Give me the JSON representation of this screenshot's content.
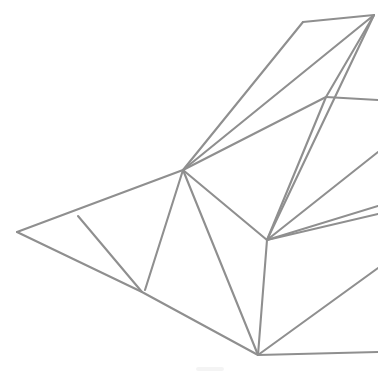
{
  "figure": {
    "width": 378,
    "height": 374,
    "background_color": "#ffffff",
    "stroke_color": "#8f8f8f",
    "stroke_width": 2.1,
    "style": "wireframe-outline"
  },
  "vertices": {
    "hub": {
      "name": "central-hub",
      "x": 183,
      "y": 170
    },
    "left_tip": {
      "name": "left-tip",
      "x": 17,
      "y": 232
    },
    "upper_branch": {
      "name": "upper-left-branch",
      "x": 78,
      "y": 216
    },
    "lower_branch": {
      "name": "lower-left-branch",
      "x": 142,
      "y": 292
    },
    "bottom": {
      "name": "bottom-apex",
      "x": 258,
      "y": 355
    },
    "mid_right": {
      "name": "mid-right-node",
      "x": 267,
      "y": 240
    },
    "top_corner": {
      "name": "top-left-corner",
      "x": 303,
      "y": 22
    },
    "top_right": {
      "name": "top-right-apex",
      "x": 374,
      "y": 15
    },
    "right_cross": {
      "name": "right-cross-node",
      "x": 326,
      "y": 97
    },
    "edge_r1": {
      "name": "right-edge-exit-1",
      "x": 378,
      "y": 100
    },
    "edge_r2": {
      "name": "right-edge-exit-2",
      "x": 378,
      "y": 152
    },
    "edge_r3": {
      "name": "right-edge-exit-3",
      "x": 378,
      "y": 206
    },
    "edge_r4": {
      "name": "right-edge-exit-4",
      "x": 378,
      "y": 214
    },
    "edge_r5": {
      "name": "right-edge-exit-5",
      "x": 378,
      "y": 268
    },
    "edge_r6": {
      "name": "right-edge-exit-6",
      "x": 378,
      "y": 352
    }
  },
  "edges": [
    {
      "id": "e01",
      "name": "hub-to-left-tip",
      "path": "M 183 170 L 17 232"
    },
    {
      "id": "e02",
      "name": "left-tip-to-lower-branch",
      "path": "M 17 232 L 142 292"
    },
    {
      "id": "e03",
      "name": "upper-branch-to-lower-branch",
      "path": "M 78 216 L 142 292"
    },
    {
      "id": "e04",
      "name": "hub-to-lower-branch-inner",
      "path": "M 183 170 L 145 290"
    },
    {
      "id": "e05",
      "name": "lower-branch-to-bottom",
      "path": "M 142 292 L 258 355"
    },
    {
      "id": "e06",
      "name": "hub-to-bottom",
      "path": "M 183 170 L 258 355"
    },
    {
      "id": "e07",
      "name": "hub-to-mid-right",
      "path": "M 183 170 L 267 240"
    },
    {
      "id": "e08",
      "name": "mid-right-to-bottom",
      "path": "M 267 240 L 258 355"
    },
    {
      "id": "e09",
      "name": "hub-to-right-cross",
      "path": "M 183 170 L 326 97"
    },
    {
      "id": "e10",
      "name": "hub-to-top-corner",
      "path": "M 183 170 L 303 22"
    },
    {
      "id": "e11",
      "name": "hub-to-top-right-apex",
      "path": "M 183 170 L 374 15"
    },
    {
      "id": "e12",
      "name": "top-corner-to-top-right-apex",
      "path": "M 303 22 L 374 15"
    },
    {
      "id": "e13",
      "name": "top-right-apex-to-right-cross",
      "path": "M 374 15 L 326 97"
    },
    {
      "id": "e14",
      "name": "right-cross-to-right-edge",
      "path": "M 326 97 L 378 100"
    },
    {
      "id": "e15",
      "name": "right-cross-to-mid-right",
      "path": "M 326 97 L 267 240"
    },
    {
      "id": "e16",
      "name": "top-right-apex-to-mid-right",
      "path": "M 374 15 L 267 240"
    },
    {
      "id": "e17",
      "name": "mid-right-to-right-edge-upper",
      "path": "M 267 240 L 378 152"
    },
    {
      "id": "e18",
      "name": "mid-right-to-right-edge-mid",
      "path": "M 267 240 L 378 206"
    },
    {
      "id": "e19",
      "name": "mid-right-to-right-edge-mid2",
      "path": "M 267 240 L 378 214"
    },
    {
      "id": "e20",
      "name": "bottom-to-right-edge-upper",
      "path": "M 258 355 L 378 268"
    },
    {
      "id": "e21",
      "name": "bottom-to-right-edge-lower",
      "path": "M 258 355 L 378 352"
    }
  ],
  "artifacts": [
    {
      "id": "a01",
      "name": "faint-smudge",
      "x": 196,
      "y": 367,
      "width": 28,
      "height": 4
    }
  ],
  "legend": {
    "visible": false,
    "items": []
  },
  "labels": {
    "visible": false,
    "items": []
  }
}
